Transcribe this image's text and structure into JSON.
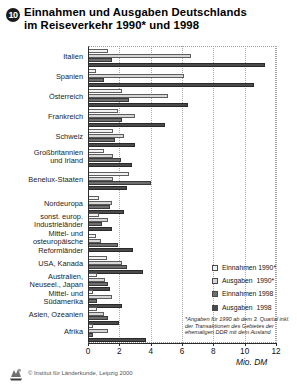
{
  "header": {
    "badge": "10",
    "title_line1": "Einnahmen und Ausgaben Deutschlands",
    "title_line2": "im Reiseverkehr 1990* und 1998"
  },
  "axis": {
    "unit": "Mio. DM",
    "ticks": [
      "0",
      "2",
      "4",
      "6",
      "8",
      "10",
      "12"
    ],
    "xmin": 0,
    "xmax": 12
  },
  "legend": {
    "position": "right-lower",
    "items": [
      {
        "label": "Einnahmen 1990*",
        "swatch": "#f2f2f2",
        "key": "e90"
      },
      {
        "label": "Ausgaben  1990*",
        "swatch": "#d6d6d6",
        "key": "a90"
      },
      {
        "label": "Einnahmen 1998",
        "swatch": "#6e6e6e",
        "key": "e98"
      },
      {
        "label": "Ausgaben  1998",
        "swatch": "#4a4a4a",
        "key": "a98"
      }
    ]
  },
  "footnote": "*Angaben für 1990 ab dem 3. Quartal inkl. der Transaktionen des Gebietes der ehemaligen DDR mit dem Ausland",
  "credit": {
    "text": "© Institut für Länderkunde, Leipzig 2000",
    "logo_name": "institut-fuer-laenderkunde-logo"
  },
  "chart_data": {
    "type": "bar",
    "orientation": "horizontal",
    "title": "Einnahmen und Ausgaben Deutschlands im Reiseverkehr 1990* und 1998",
    "xlabel": "Mio. DM",
    "ylabel": "",
    "xlim": [
      0,
      12
    ],
    "grid": true,
    "grid_axis": "x",
    "legend_position": "right",
    "categories": [
      "Italien",
      "Spanien",
      "Österreich",
      "Frankreich",
      "Schweiz",
      "Großbritannien und Irland",
      "Benelux-Staaten",
      "Nordeuropa",
      "sonst. europ. Industrieländer",
      "Mittel- und osteuropäische Reformländer",
      "USA, Kanada",
      "Australien, Neuseel., Japan",
      "Mittel- und Südamerika",
      "Asien, Ozeanien",
      "Afrika"
    ],
    "category_lines": [
      [
        "Italien"
      ],
      [
        "Spanien"
      ],
      [
        "Österreich"
      ],
      [
        "Frankreich"
      ],
      [
        "Schweiz"
      ],
      [
        "Großbritannien",
        "und Irland"
      ],
      [
        "Benelux-Staaten"
      ],
      [
        "Nordeuropa"
      ],
      [
        "sonst. europ.",
        "Industrieländer"
      ],
      [
        "Mittel- und",
        "osteuropäische",
        "Reformländer"
      ],
      [
        "USA, Kanada"
      ],
      [
        "Australien,",
        "Neuseel., Japan"
      ],
      [
        "Mittel- und",
        "Südamerika"
      ],
      [
        "Asien, Ozeanien"
      ],
      [
        "Afrika"
      ]
    ],
    "series": [
      {
        "name": "Einnahmen 1990*",
        "color": "#f2f2f2",
        "values": [
          1.3,
          0.5,
          2.2,
          1.9,
          1.6,
          1.0,
          2.6,
          0.7,
          0.7,
          0.5,
          1.2,
          0.6,
          0.3,
          0.6,
          0.3
        ]
      },
      {
        "name": "Ausgaben 1990*",
        "color": "#d6d6d6",
        "values": [
          6.6,
          6.1,
          5.1,
          3.0,
          2.3,
          1.6,
          1.6,
          1.5,
          1.3,
          0.8,
          2.2,
          1.1,
          1.5,
          1.0,
          1.3
        ]
      },
      {
        "name": "Einnahmen 1998",
        "color": "#6e6e6e",
        "values": [
          1.5,
          1.0,
          2.6,
          2.2,
          1.7,
          2.1,
          4.0,
          1.4,
          0.9,
          1.9,
          2.5,
          1.3,
          0.6,
          1.3,
          0.3
        ]
      },
      {
        "name": "Ausgaben 1998",
        "color": "#4a4a4a",
        "values": [
          11.3,
          10.6,
          6.4,
          4.9,
          3.0,
          2.8,
          2.5,
          2.3,
          1.5,
          2.9,
          3.5,
          1.4,
          2.2,
          2.0,
          3.7
        ]
      }
    ]
  }
}
